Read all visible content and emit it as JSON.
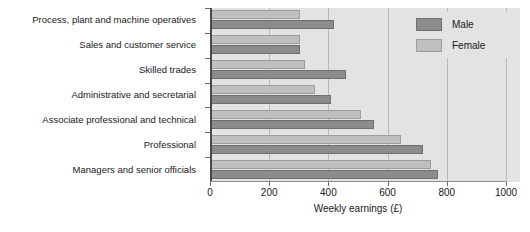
{
  "chart_data": {
    "type": "bar",
    "orientation": "horizontal",
    "title": "",
    "xlabel": "Weekly earnings (£)",
    "ylabel": "",
    "xlim": [
      0,
      1000
    ],
    "xticks": [
      0,
      200,
      400,
      600,
      800,
      1000
    ],
    "xticklabels": [
      "0",
      "200",
      "400",
      "600",
      "800",
      "1000"
    ],
    "grid": true,
    "legend_position": "top-right",
    "categories": [
      "Process, plant and machine operatives",
      "Sales and customer service",
      "Skilled trades",
      "Administrative and secretarial",
      "Associate professional and technical",
      "Professional",
      "Managers and senior officials"
    ],
    "series": [
      {
        "name": "Male",
        "color": "#8c8c8c",
        "values": [
          420,
          305,
          460,
          408,
          555,
          720,
          770
        ]
      },
      {
        "name": "Female",
        "color": "#bfbfbf",
        "values": [
          305,
          305,
          320,
          355,
          510,
          645,
          745
        ]
      }
    ]
  },
  "legend": {
    "items": [
      {
        "label": "Male"
      },
      {
        "label": "Female"
      }
    ]
  },
  "axis": {
    "x_title": "Weekly earnings (£)",
    "tick_labels": [
      "0",
      "200",
      "400",
      "600",
      "800",
      "1000"
    ]
  },
  "colors": {
    "plot_background": "#e3e3e3",
    "page_background": "#ffffff",
    "gridline": "#b9b9b9",
    "axis": "#4a4a4a",
    "male": "#8c8c8c",
    "female": "#bfbfbf",
    "text": "#1a1a1a"
  }
}
